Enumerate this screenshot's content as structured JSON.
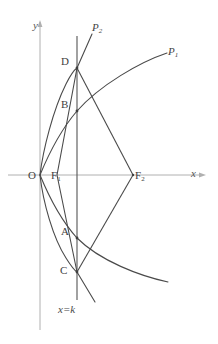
{
  "figure": {
    "type": "geometry-diagram",
    "width": 218,
    "height": 344,
    "background_color": "#ffffff",
    "stroke_color": "#4a4a4a",
    "axis_color": "#9a9a9a"
  },
  "axes": {
    "x_axis_label": "x",
    "y_axis_label": "y",
    "origin_label": "O",
    "x_axis_y_px": 175,
    "y_axis_x_px": 40
  },
  "points": [
    {
      "id": "O",
      "label": "O",
      "x_px": 40,
      "y_px": 175
    },
    {
      "id": "D",
      "label": "D",
      "x_px": 77,
      "y_px": 68
    },
    {
      "id": "B",
      "label": "B",
      "x_px": 77,
      "y_px": 111
    },
    {
      "id": "A",
      "label": "A",
      "x_px": 77,
      "y_px": 238
    },
    {
      "id": "C",
      "label": "C",
      "x_px": 77,
      "y_px": 272
    },
    {
      "id": "F1",
      "label": "F",
      "sub": "1",
      "x_px": 57,
      "y_px": 175
    },
    {
      "id": "F2",
      "label": "F",
      "sub": "2",
      "x_px": 133,
      "y_px": 175
    }
  ],
  "curves": [
    {
      "id": "P1",
      "label": "P",
      "sub": "1",
      "label_x_px": 170,
      "label_y_px": 50,
      "description": "wide parabola through B and A, vertex at O"
    },
    {
      "id": "P2",
      "label": "P",
      "sub": "2",
      "label_x_px": 94,
      "label_y_px": 25,
      "description": "narrow parabola through D and C, vertex at O"
    }
  ],
  "lines": {
    "vertical_line_label": "x=k",
    "vertical_line_x_px": 77,
    "vertical_line_label_x_px": 60,
    "vertical_line_label_y_px": 304
  }
}
